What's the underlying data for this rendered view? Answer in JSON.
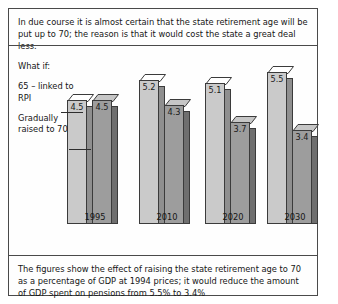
{
  "figure": {
    "intro_text": "In due course it is almost certain that the state retirement age will be put up to 70; the reason is that it would cost the state a great deal less.",
    "caption_text": "The figures show the effect of raising the state retirement age to 70 as a percentage of GDP at 1994 prices; it would reduce the amount of GDP spent on pensions from 5.5% to 3.4%"
  },
  "legend": {
    "title": "What if:",
    "series1": "65 – linked to RPI",
    "series2": "Gradually raised to 70"
  },
  "chart_data": {
    "type": "bar",
    "title": "",
    "xlabel": "",
    "ylabel": "",
    "ylim": [
      0,
      5.5
    ],
    "grid": false,
    "legend_position": "left",
    "categories": [
      "1995",
      "2010",
      "2020",
      "2030"
    ],
    "series": [
      {
        "name": "65 – linked to RPI",
        "values": [
          4.5,
          5.2,
          5.1,
          5.5
        ],
        "color": "#cacaca"
      },
      {
        "name": "Gradually raised to 70",
        "values": [
          4.5,
          4.3,
          3.7,
          3.4
        ],
        "color": "#9d9d9d"
      }
    ]
  }
}
